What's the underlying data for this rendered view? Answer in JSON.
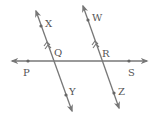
{
  "diagram": {
    "colors": {
      "line": "#777777",
      "label": "#555555",
      "background": "#ffffff"
    },
    "points": {
      "P": "P",
      "S": "S",
      "X": "X",
      "Q": "Q",
      "Y": "Y",
      "W": "W",
      "R": "R",
      "Z": "Z"
    },
    "lines": [
      {
        "name": "PS",
        "through": [
          "P",
          "Q",
          "R",
          "S"
        ],
        "type": "horizontal"
      },
      {
        "name": "XY",
        "through": [
          "X",
          "Q",
          "Y"
        ],
        "parallel_to": "WZ"
      },
      {
        "name": "WZ",
        "through": [
          "W",
          "R",
          "Z"
        ],
        "parallel_to": "XY"
      }
    ],
    "parallel_marks": "double-arrow on XY and WZ"
  }
}
